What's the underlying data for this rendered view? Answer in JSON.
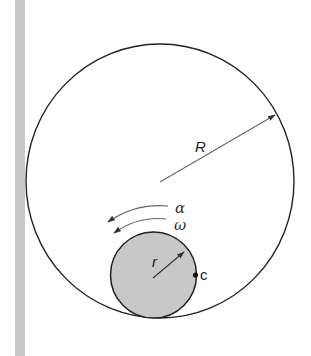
{
  "diagram": {
    "colors": {
      "wall": "#c9c9c9",
      "stroke": "#222222",
      "arrow": "#555555",
      "disk_fill": "#c8c8c8"
    },
    "outer_circle": {
      "cx": 160,
      "cy": 181,
      "rx": 134,
      "ry": 137
    },
    "inner_disk": {
      "cx": 153.5,
      "cy": 275,
      "r": 43
    },
    "labels": {
      "big_radius": "R",
      "small_radius": "r",
      "angular_acceleration": "α",
      "angular_velocity": "ω",
      "point": "c"
    }
  }
}
